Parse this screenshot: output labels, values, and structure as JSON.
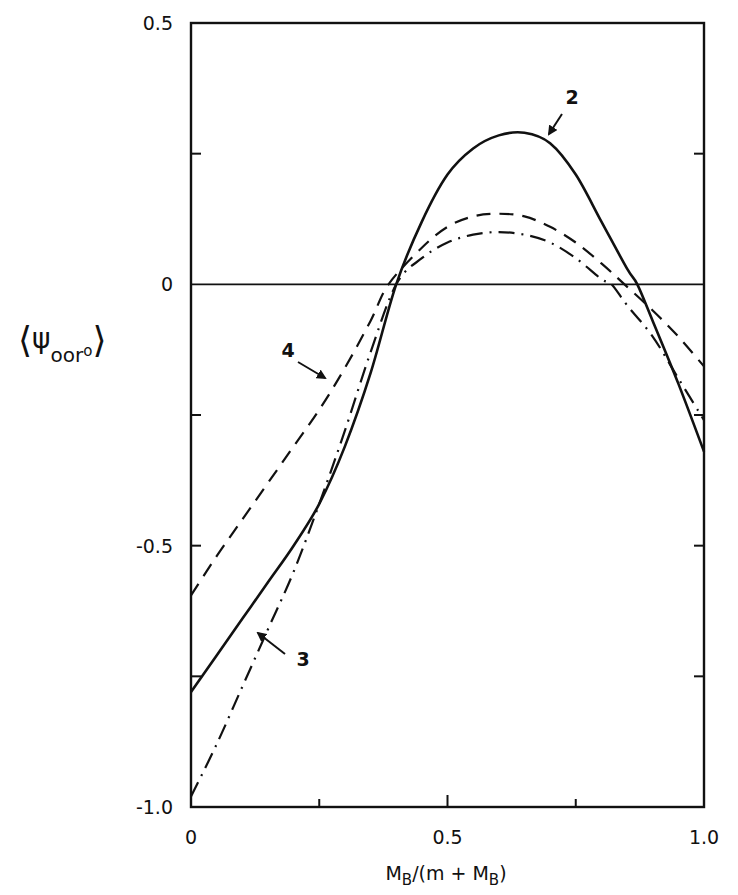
{
  "chart_data": {
    "type": "line",
    "title": "",
    "xlabel": "M_B/(m + M_B)",
    "xlabel_parts": {
      "main": "M",
      "sub1": "B",
      "mid": "/(m + M",
      "sub2": "B",
      "end": ")"
    },
    "ylabel": "⟨ψ_oor o⟩",
    "ylabel_parts": {
      "open": "⟨",
      "psi": "ψ",
      "sub": "oor",
      "sup": "o",
      "close": "⟩"
    },
    "xlim": [
      0,
      1.0
    ],
    "ylim": [
      -1.0,
      0.5
    ],
    "grid": false,
    "legend": "none (curves labeled inline with arrows)",
    "x_ticks": [
      0,
      0.25,
      0.5,
      0.75,
      1.0
    ],
    "x_tick_labels": [
      "0",
      "",
      "0.5",
      "",
      "1.0"
    ],
    "y_ticks": [
      -1.0,
      -0.75,
      -0.5,
      -0.25,
      0,
      0.25,
      0.5
    ],
    "y_tick_labels": [
      "-1.0",
      "",
      "-0.5",
      "",
      "0",
      "",
      "0.5"
    ],
    "reference_line": {
      "y": 0,
      "style": "solid"
    },
    "series": [
      {
        "name": "2",
        "style": "solid",
        "x": [
          0,
          0.05,
          0.1,
          0.15,
          0.2,
          0.25,
          0.3,
          0.35,
          0.4,
          0.45,
          0.5,
          0.55,
          0.6,
          0.65,
          0.7,
          0.75,
          0.8,
          0.85,
          0.87,
          0.9,
          0.95,
          1.0
        ],
        "values": [
          -0.78,
          -0.71,
          -0.64,
          -0.57,
          -0.5,
          -0.42,
          -0.31,
          -0.17,
          0.0,
          0.12,
          0.21,
          0.26,
          0.285,
          0.29,
          0.27,
          0.21,
          0.12,
          0.03,
          0.0,
          -0.07,
          -0.19,
          -0.32
        ],
        "label_text": "2",
        "label_pos": [
          0.74,
          0.36
        ]
      },
      {
        "name": "3",
        "style": "dashdot",
        "x": [
          0,
          0.05,
          0.1,
          0.15,
          0.2,
          0.25,
          0.3,
          0.35,
          0.4,
          0.45,
          0.5,
          0.55,
          0.6,
          0.65,
          0.7,
          0.75,
          0.8,
          0.82,
          0.85,
          0.9,
          0.95,
          1.0
        ],
        "values": [
          -0.98,
          -0.88,
          -0.77,
          -0.66,
          -0.55,
          -0.42,
          -0.28,
          -0.13,
          0.0,
          0.05,
          0.08,
          0.095,
          0.1,
          0.095,
          0.08,
          0.05,
          0.01,
          0.0,
          -0.04,
          -0.1,
          -0.18,
          -0.26
        ],
        "label_text": "3",
        "label_pos": [
          0.22,
          -0.72
        ]
      },
      {
        "name": "4",
        "style": "dashed",
        "x": [
          0,
          0.05,
          0.1,
          0.15,
          0.2,
          0.25,
          0.3,
          0.35,
          0.385,
          0.45,
          0.5,
          0.55,
          0.6,
          0.65,
          0.7,
          0.75,
          0.8,
          0.845,
          0.9,
          0.95,
          1.0
        ],
        "values": [
          -0.595,
          -0.52,
          -0.45,
          -0.38,
          -0.31,
          -0.24,
          -0.16,
          -0.07,
          0.0,
          0.07,
          0.11,
          0.13,
          0.135,
          0.13,
          0.11,
          0.08,
          0.04,
          0.0,
          -0.05,
          -0.1,
          -0.157
        ],
        "label_text": "4",
        "label_pos": [
          0.19,
          -0.13
        ]
      }
    ]
  }
}
